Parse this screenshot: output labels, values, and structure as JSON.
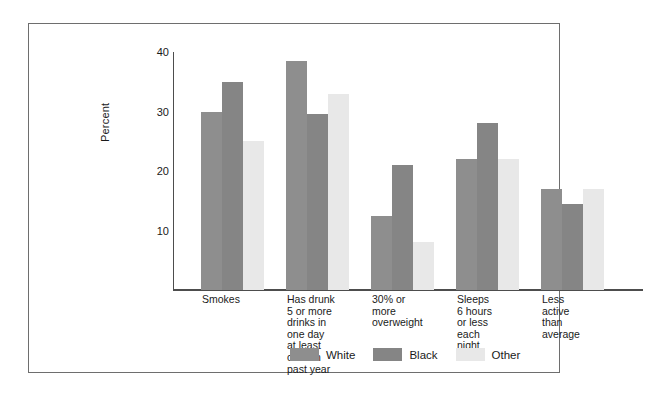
{
  "chart_data": {
    "type": "bar",
    "title": "",
    "subtitle": "",
    "xlabel": "",
    "ylabel": "Percent",
    "ylim": [
      0,
      40
    ],
    "yticks": [
      10,
      20,
      30,
      40
    ],
    "grid": false,
    "legend_position": "bottom-center",
    "categories": [
      "Smokes",
      "Has drunk\n5 or more\ndrinks in\none day\nat least\nonce in\npast year",
      "30% or\nmore\noverweight",
      "Sleeps\n6 hours\nor less\neach\nnight",
      "Less\nactive\nthan\naverage"
    ],
    "category_lines": [
      [
        "Smokes"
      ],
      [
        "Has drunk",
        "5 or more",
        "drinks in",
        "one day",
        "at least",
        "once in",
        "past year"
      ],
      [
        "30% or",
        "more",
        "overweight"
      ],
      [
        "Sleeps",
        "6 hours",
        "or less",
        "each",
        "night"
      ],
      [
        "Less",
        "active",
        "than",
        "average"
      ]
    ],
    "series": [
      {
        "name": "White",
        "color": "#8e8e8e",
        "values": [
          30.0,
          38.5,
          12.5,
          22.0,
          17.0
        ]
      },
      {
        "name": "Black",
        "color": "#858585",
        "values": [
          35.0,
          29.5,
          21.0,
          28.0,
          14.5
        ]
      },
      {
        "name": "Other",
        "color": "#e8e8e8",
        "values": [
          25.0,
          33.0,
          8.0,
          22.0,
          17.0
        ]
      }
    ]
  },
  "legend": {
    "items": [
      {
        "label": "White",
        "color": "#8e8e8e"
      },
      {
        "label": "Black",
        "color": "#858585"
      },
      {
        "label": "Other",
        "color": "#e8e8e8"
      }
    ]
  },
  "axis": {
    "y_title": "Percent",
    "y_tick_labels": [
      "40",
      "30",
      "20",
      "10"
    ]
  }
}
